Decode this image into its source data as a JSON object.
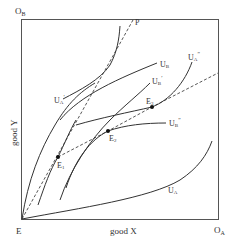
{
  "diagram": {
    "type": "Edgeworth box",
    "origins": {
      "bottom_left": "E",
      "top_left": "O",
      "top_left_sub": "B",
      "bottom_right": "O",
      "bottom_right_sub": "A"
    },
    "axes": {
      "x_label": "good X",
      "y_label": "good Y"
    },
    "curves": {
      "U_A": {
        "base": "U",
        "sub": "A",
        "sup": ""
      },
      "U_A_prime": {
        "base": "U",
        "sub": "A",
        "sup": "′"
      },
      "U_A_double": {
        "base": "U",
        "sub": "A",
        "sup": "″"
      },
      "U_B": {
        "base": "U",
        "sub": "B",
        "sup": ""
      },
      "U_B_prime": {
        "base": "U",
        "sub": "B",
        "sup": "′"
      },
      "U_B_double": {
        "base": "U",
        "sub": "B",
        "sup": "″"
      }
    },
    "points": [
      {
        "id": "E1",
        "base": "E",
        "sub": "1"
      },
      {
        "id": "E2",
        "base": "E",
        "sub": "2"
      },
      {
        "id": "E3",
        "base": "E",
        "sub": "3"
      }
    ],
    "price_line_label": "P",
    "colors": {
      "line": "#333333",
      "dashed": "#444444",
      "border": "#555555"
    }
  }
}
